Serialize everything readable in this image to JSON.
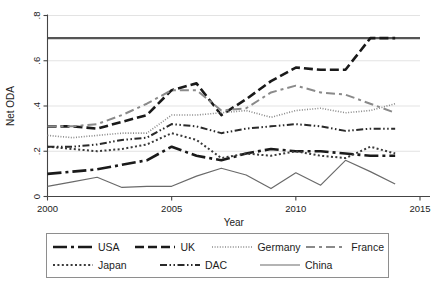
{
  "chart_data": {
    "type": "line",
    "title": "",
    "xlabel": "Year",
    "ylabel": "Net ODA",
    "xlim": [
      2000,
      2015
    ],
    "ylim": [
      0,
      0.8
    ],
    "xticks": [
      2000,
      2005,
      2010,
      2015
    ],
    "xtick_labels": [
      "2000",
      "2005",
      "2010",
      "2015"
    ],
    "yticks": [
      0,
      0.2,
      0.4,
      0.6,
      0.8
    ],
    "ytick_labels": [
      "0",
      ".2",
      ".4",
      ".6",
      ".8"
    ],
    "grid": true,
    "legend_position": "below",
    "reference_line": {
      "name": "un-target-line",
      "value": 0.7,
      "orientation": "horizontal",
      "color": "#555555"
    },
    "x": [
      2000,
      2001,
      2002,
      2003,
      2004,
      2005,
      2006,
      2007,
      2008,
      2009,
      2010,
      2011,
      2012,
      2013,
      2014
    ],
    "series": [
      {
        "name": "USA",
        "color": "#1a1a1a",
        "dash": "14,4,3,4",
        "width": 2.6,
        "values": [
          0.1,
          0.11,
          0.12,
          0.14,
          0.16,
          0.22,
          0.18,
          0.16,
          0.19,
          0.21,
          0.2,
          0.2,
          0.19,
          0.18,
          0.18
        ]
      },
      {
        "name": "UK",
        "color": "#1a1a1a",
        "dash": "9,4",
        "width": 2.6,
        "values": [
          0.31,
          0.31,
          0.3,
          0.33,
          0.36,
          0.47,
          0.5,
          0.36,
          0.43,
          0.51,
          0.57,
          0.56,
          0.56,
          0.7,
          0.7
        ]
      },
      {
        "name": "Germany",
        "color": "#8a8a8a",
        "dash": "1,1.6",
        "width": 1.6,
        "values": [
          0.27,
          0.26,
          0.27,
          0.28,
          0.28,
          0.36,
          0.36,
          0.37,
          0.38,
          0.35,
          0.38,
          0.39,
          0.37,
          0.38,
          0.41
        ]
      },
      {
        "name": "France",
        "color": "#8a8a8a",
        "dash": "9,4,3,4",
        "width": 2.0,
        "values": [
          0.31,
          0.31,
          0.32,
          0.36,
          0.41,
          0.47,
          0.47,
          0.38,
          0.39,
          0.46,
          0.49,
          0.46,
          0.45,
          0.41,
          0.37
        ]
      },
      {
        "name": "Japan",
        "color": "#3a3a3a",
        "dash": "2,2.4",
        "width": 2.0,
        "values": [
          0.22,
          0.21,
          0.2,
          0.21,
          0.23,
          0.28,
          0.25,
          0.17,
          0.19,
          0.18,
          0.2,
          0.18,
          0.17,
          0.22,
          0.19
        ]
      },
      {
        "name": "DAC",
        "color": "#2a2a2a",
        "dash": "7,2.5,1.5,2.5,1.5,2.5",
        "width": 2.0,
        "values": [
          0.22,
          0.22,
          0.23,
          0.25,
          0.26,
          0.32,
          0.31,
          0.28,
          0.3,
          0.31,
          0.32,
          0.31,
          0.29,
          0.3,
          0.3
        ]
      },
      {
        "name": "China",
        "color": "#6a6a6a",
        "dash": "",
        "width": 1.2,
        "values": [
          0.045,
          0.065,
          0.085,
          0.04,
          0.045,
          0.045,
          0.09,
          0.125,
          0.095,
          0.035,
          0.105,
          0.05,
          0.16,
          0.11,
          0.055
        ]
      }
    ]
  },
  "legend": {
    "rows": [
      [
        "USA",
        "UK",
        "Germany",
        "France"
      ],
      [
        "Japan",
        "DAC",
        "China"
      ]
    ]
  }
}
